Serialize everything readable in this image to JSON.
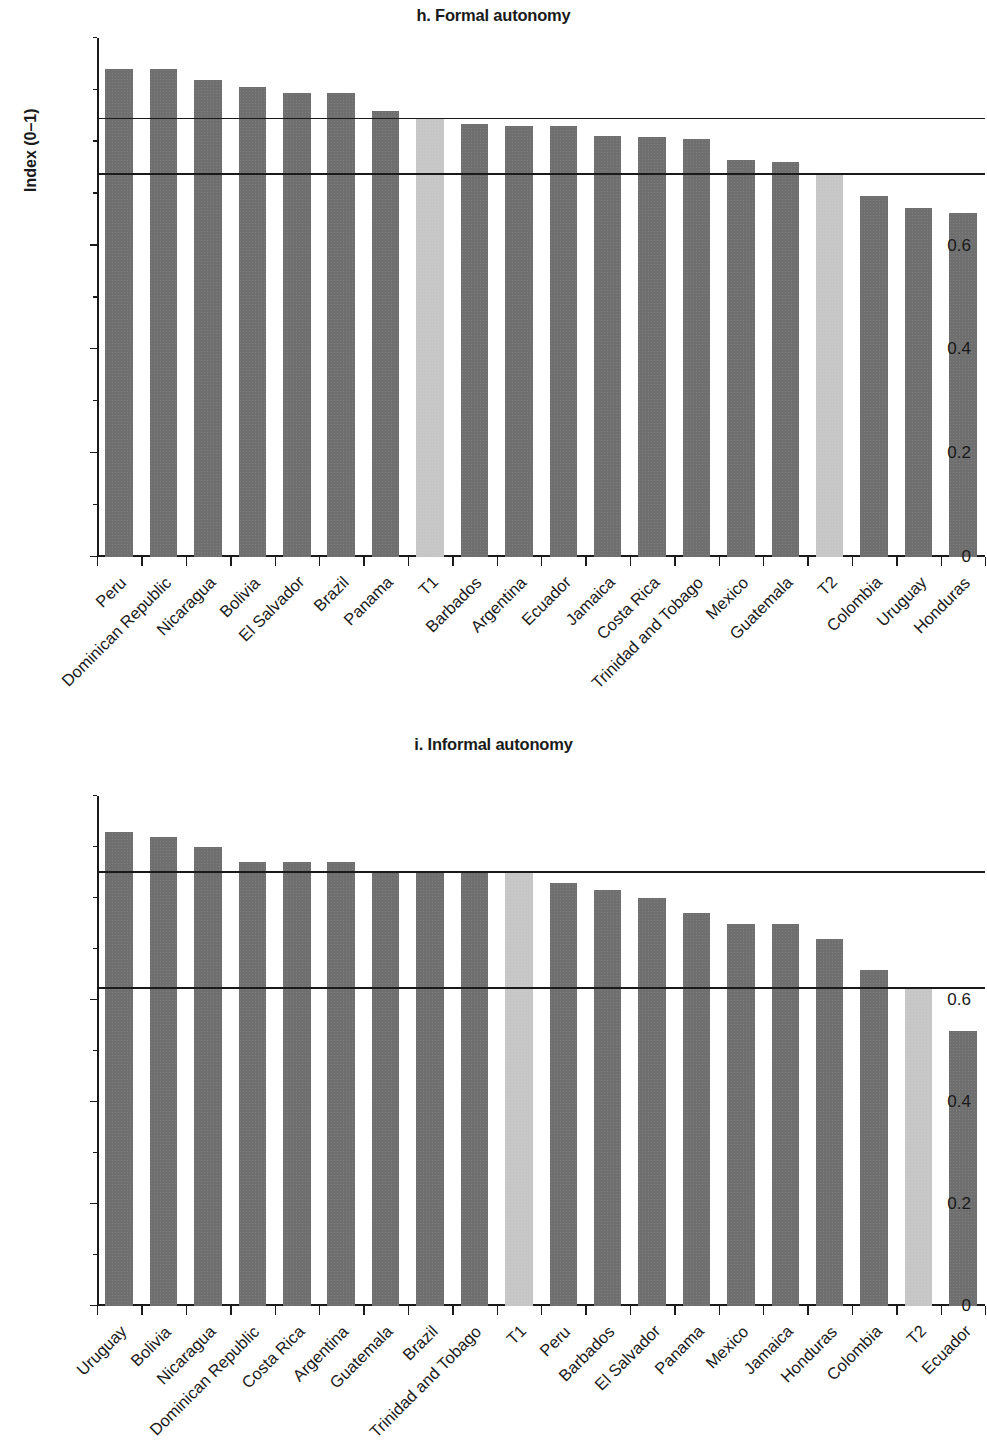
{
  "figure": {
    "y_axis_label": "Index (0–1)",
    "y_ticks": [
      "1.0",
      "0.8",
      "0.6",
      "0.4",
      "0.2",
      "0"
    ],
    "colors": {
      "bar_dark": "#6f6f6f",
      "bar_light": "#c6c6c6",
      "axis": "#1a1a1a",
      "background": "#ffffff"
    }
  },
  "panels": [
    {
      "id": "h",
      "title": "h. Formal autonomy"
    },
    {
      "id": "i",
      "title": "i. Informal autonomy"
    }
  ],
  "chart_data": [
    {
      "type": "bar",
      "title": "h. Formal autonomy",
      "xlabel": "",
      "ylabel": "Index (0–1)",
      "ylim": [
        0,
        1.0
      ],
      "yticks": [
        0,
        0.2,
        0.4,
        0.6,
        0.8,
        1.0
      ],
      "ytick_labels": [
        "0",
        "0.2",
        "0.4",
        "0.6",
        "0.8",
        "1.0"
      ],
      "grid": false,
      "legend": "none",
      "categories": [
        "Peru",
        "Dominican Republic",
        "Nicaragua",
        "Bolivia",
        "El Salvador",
        "Brazil",
        "Panama",
        "T1",
        "Barbados",
        "Argentina",
        "Ecuador",
        "Jamaica",
        "Costa Rica",
        "Trinidad and Tobago",
        "Mexico",
        "Guatemala",
        "T2",
        "Colombia",
        "Uruguay",
        "Honduras"
      ],
      "values": [
        0.94,
        0.94,
        0.92,
        0.905,
        0.895,
        0.895,
        0.86,
        0.843,
        0.835,
        0.83,
        0.83,
        0.812,
        0.81,
        0.806,
        0.765,
        0.762,
        0.737,
        0.695,
        0.672,
        0.662
      ],
      "highlighted": [
        "T1",
        "T2"
      ],
      "reference_lines": [
        0.843,
        0.737
      ],
      "annotations": [
        "T1 bar marks the upper reference line at 0.84",
        "T2 bar marks the lower reference line at 0.74"
      ]
    },
    {
      "type": "bar",
      "title": "i. Informal autonomy",
      "xlabel": "",
      "ylabel": "Index (0–1)",
      "ylim": [
        0,
        1.0
      ],
      "yticks": [
        0,
        0.2,
        0.4,
        0.6,
        0.8,
        1.0
      ],
      "ytick_labels": [
        "0",
        "0.2",
        "0.4",
        "0.6",
        "0.8",
        "1.0"
      ],
      "grid": false,
      "legend": "none",
      "categories": [
        "Uruguay",
        "Bolivia",
        "Nicaragua",
        "Dominican Republic",
        "Costa Rica",
        "Argentina",
        "Guatemala",
        "Brazil",
        "Trinidad and Tobago",
        "T1",
        "Peru",
        "Barbados",
        "El Salvador",
        "Panama",
        "Mexico",
        "Jamaica",
        "Honduras",
        "Colombia",
        "T2",
        "Ecuador"
      ],
      "values": [
        0.93,
        0.92,
        0.9,
        0.87,
        0.87,
        0.87,
        0.852,
        0.852,
        0.852,
        0.85,
        0.83,
        0.815,
        0.8,
        0.77,
        0.75,
        0.75,
        0.72,
        0.658,
        0.622,
        0.54
      ],
      "highlighted": [
        "T1",
        "T2"
      ],
      "reference_lines": [
        0.85,
        0.622
      ],
      "annotations": [
        "T1 bar marks the upper reference line at 0.85",
        "T2 bar marks the lower reference line at 0.62"
      ]
    }
  ]
}
